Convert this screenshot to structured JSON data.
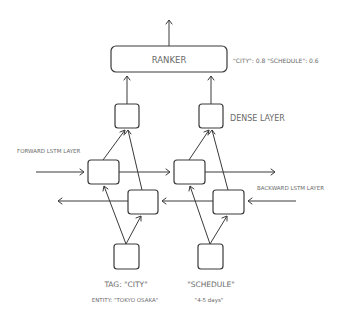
{
  "diagram": {
    "ranker_label": "RANKER",
    "ranker_scores": "\"CITY\": 0.8  \"SCHEDULE\": 0.6",
    "dense_layer_label": "DENSE LAYER",
    "forward_lstm_label": "FORWARD LSTM LAYER",
    "backward_lstm_label": "BACKWARD LSTM LAYER",
    "inputs": [
      {
        "tag": "TAG: \"CITY\"",
        "entity": "ENTITY: \"TOKYO OSAKA\""
      },
      {
        "tag": "\"SCHEDULE\"",
        "entity": "\"4-5 days\""
      }
    ]
  }
}
